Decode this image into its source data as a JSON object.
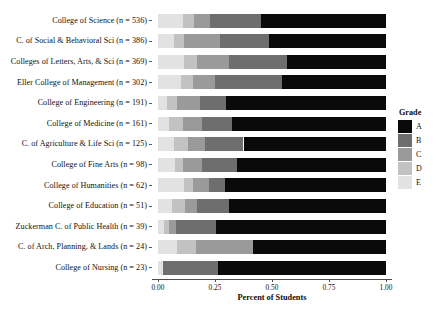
{
  "chart_data": {
    "type": "bar",
    "orientation": "horizontal",
    "stacked": true,
    "normalized": true,
    "title": "",
    "xlabel": "Percent of Students",
    "ylabel": "",
    "xlim": [
      0.0,
      1.0
    ],
    "xticks": [
      "0.00",
      "0.25",
      "0.50",
      "0.75",
      "1.00"
    ],
    "xtick_values": [
      0.0,
      0.25,
      0.5,
      0.75,
      1.0
    ],
    "grid": false,
    "legend": {
      "title": "Grade",
      "position": "right",
      "entries": [
        {
          "label": "A",
          "color": "#0a0a0a"
        },
        {
          "label": "B",
          "color": "#6e6e6e"
        },
        {
          "label": "C",
          "color": "#9a9a9a"
        },
        {
          "label": "D",
          "color": "#c2c2c2"
        },
        {
          "label": "E",
          "color": "#e2e2e2"
        }
      ]
    },
    "categories": [
      "College of Science (n = 536)",
      "C. of Social & Behavioral Sci (n = 386)",
      "Colleges of Letters, Arts, & Sci (n = 369)",
      "Eller College of Management (n = 302)",
      "College of Engineering (n = 191)",
      "College of Medicine (n = 161)",
      "C. of Agriculture & Life Sci (n = 125)",
      "College of Fine Arts (n = 98)",
      "College of Humanities (n = 62)",
      "College of Education (n = 51)",
      "Zuckerman C. of Public Health (n = 39)",
      "C. of Arch, Planning, & Lands (n = 24)",
      "College of Nursing (n = 23)"
    ],
    "counts": [
      536,
      386,
      369,
      302,
      191,
      161,
      125,
      98,
      62,
      51,
      39,
      24,
      23
    ],
    "series": [
      {
        "name": "E",
        "color": "#e2e2e2",
        "values": [
          0.11,
          0.07,
          0.115,
          0.1,
          0.04,
          0.05,
          0.07,
          0.075,
          0.115,
          0.06,
          0.025,
          0.085,
          0.02
        ]
      },
      {
        "name": "D",
        "color": "#c2c2c2",
        "values": [
          0.05,
          0.045,
          0.055,
          0.055,
          0.045,
          0.06,
          0.06,
          0.035,
          0.04,
          0.06,
          0.025,
          0.08,
          0.0
        ]
      },
      {
        "name": "C",
        "color": "#9a9a9a",
        "values": [
          0.07,
          0.155,
          0.14,
          0.095,
          0.1,
          0.085,
          0.075,
          0.085,
          0.07,
          0.05,
          0.027,
          0.25,
          0.0
        ]
      },
      {
        "name": "B",
        "color": "#6e6e6e",
        "values": [
          0.22,
          0.215,
          0.255,
          0.295,
          0.115,
          0.13,
          0.17,
          0.15,
          0.07,
          0.14,
          0.178,
          0.0,
          0.245
        ]
      },
      {
        "name": "A",
        "color": "#0a0a0a",
        "values": [
          0.55,
          0.515,
          0.435,
          0.455,
          0.7,
          0.675,
          0.625,
          0.655,
          0.705,
          0.69,
          0.745,
          0.585,
          0.735
        ]
      }
    ]
  }
}
